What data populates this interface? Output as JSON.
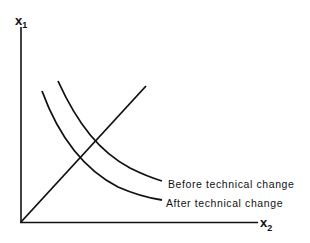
{
  "diagram": {
    "type": "isoquant-shift",
    "y_axis_label": "x",
    "y_axis_subscript": "1",
    "x_axis_label": "x",
    "x_axis_subscript": "2",
    "curves": [
      {
        "name": "before",
        "label": "Before technical change"
      },
      {
        "name": "after",
        "label": "After technical change"
      }
    ],
    "ray": "line from origin through both isoquants",
    "colors": {
      "ink": "#111111",
      "background": "#ffffff"
    }
  }
}
